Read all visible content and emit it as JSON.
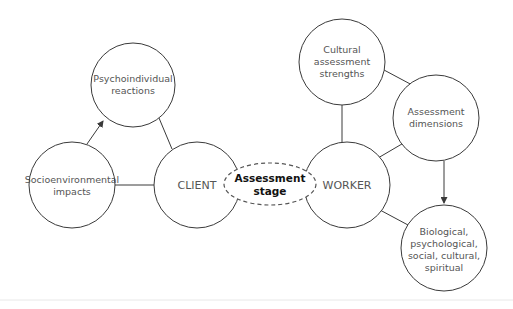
{
  "diagram": {
    "nodes": {
      "psychoindividual": {
        "lines": [
          "Psychoindividual",
          "reactions"
        ]
      },
      "socioenvironmental": {
        "lines": [
          "Socioenvironmental",
          "impacts"
        ]
      },
      "client": {
        "lines": [
          "CLIENT"
        ]
      },
      "assessment_stage": {
        "lines": [
          "Assessment",
          "stage"
        ]
      },
      "worker": {
        "lines": [
          "WORKER"
        ]
      },
      "cultural": {
        "lines": [
          "Cultural",
          "assessment",
          "strengths"
        ]
      },
      "dimensions": {
        "lines": [
          "Assessment",
          "dimensions"
        ]
      },
      "biological": {
        "lines": [
          "Biological,",
          "psychological,",
          "social, cultural,",
          "spiritual"
        ]
      }
    },
    "edges": [
      {
        "from": "socioenvironmental",
        "to": "psychoindividual",
        "arrow": true
      },
      {
        "from": "psychoindividual",
        "to": "client",
        "arrow": false
      },
      {
        "from": "socioenvironmental",
        "to": "client",
        "arrow": false
      },
      {
        "from": "cultural",
        "to": "worker",
        "arrow": false
      },
      {
        "from": "cultural",
        "to": "dimensions",
        "arrow": false
      },
      {
        "from": "dimensions",
        "to": "worker",
        "arrow": false
      },
      {
        "from": "dimensions",
        "to": "biological",
        "arrow": true
      },
      {
        "from": "worker",
        "to": "biological",
        "arrow": false
      }
    ],
    "colors": {
      "stroke": "#3a3a3a",
      "text": "#555555",
      "stage_text": "#111111",
      "background": "#ffffff"
    }
  }
}
